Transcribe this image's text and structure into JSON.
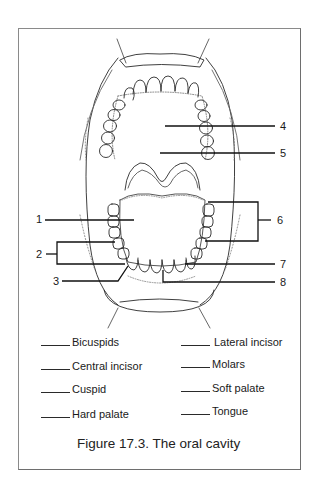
{
  "figure": {
    "caption": "Figure 17.3. The oral cavity",
    "callouts": [
      {
        "id": "1",
        "label": "1"
      },
      {
        "id": "2",
        "label": "2"
      },
      {
        "id": "3",
        "label": "3"
      },
      {
        "id": "4",
        "label": "4"
      },
      {
        "id": "5",
        "label": "5"
      },
      {
        "id": "6",
        "label": "6"
      },
      {
        "id": "7",
        "label": "7"
      },
      {
        "id": "8",
        "label": "8"
      }
    ]
  },
  "answer_key": {
    "left_column": [
      {
        "blank": "",
        "term": "Bicuspids"
      },
      {
        "blank": "",
        "term": "Central incisor"
      },
      {
        "blank": "",
        "term": "Cuspid"
      },
      {
        "blank": "",
        "term": "Hard palate"
      }
    ],
    "right_column": [
      {
        "blank": "",
        "term": "Lateral incisor"
      },
      {
        "blank": "",
        "term": "Molars"
      },
      {
        "blank": "",
        "term": "Soft palate"
      },
      {
        "blank": "",
        "term": "Tongue"
      }
    ]
  },
  "colors": {
    "ink": "#1a1a1a",
    "frame": "#7a7a7a",
    "background": "#ffffff"
  }
}
